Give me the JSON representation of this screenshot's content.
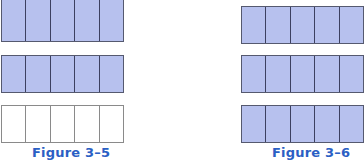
{
  "figures": [
    {
      "caption": "Figure 3–5",
      "strips": [
        {
          "cells": 5,
          "shaded": 5
        },
        {
          "cells": 5,
          "shaded": 5
        },
        {
          "cells": 5,
          "shaded": 0
        }
      ]
    },
    {
      "caption": "Figure 3–6",
      "strips": [
        {
          "cells": 5,
          "shaded": 5
        },
        {
          "cells": 5,
          "shaded": 5
        },
        {
          "cells": 5,
          "shaded": 5
        }
      ]
    }
  ],
  "colors": {
    "shaded_fill": "#b7c1ee",
    "border": "#3c4060",
    "empty_border": "#8a8a8a",
    "caption": "#2b5fc4"
  }
}
